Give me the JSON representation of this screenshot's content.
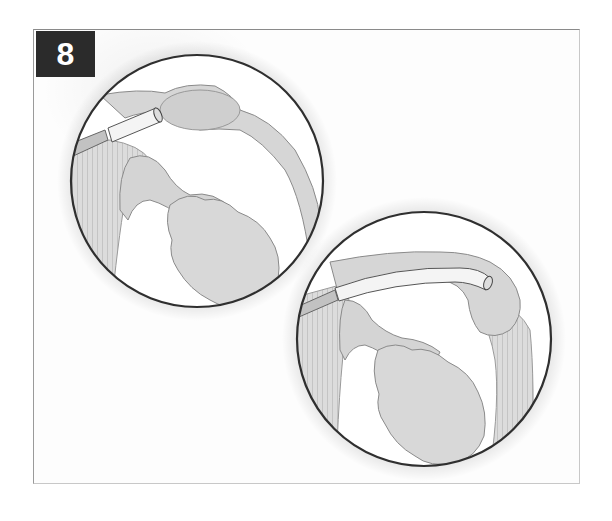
{
  "figure": {
    "step_number": "8",
    "colors": {
      "badge_background": "#2b2b2b",
      "badge_text": "#ffffff",
      "outline": "#333333",
      "tissue_fill": "#d9d9d9",
      "background": "#ffffff"
    },
    "insets": [
      {
        "id": "inset-1",
        "description": "magnified view: straight tube inserted at duct opening",
        "center": [
          197,
          181
        ],
        "radius": 127
      },
      {
        "id": "inset-2",
        "description": "magnified view: tube advanced along curved duct to far end",
        "center": [
          424,
          339
        ],
        "radius": 128
      }
    ]
  }
}
